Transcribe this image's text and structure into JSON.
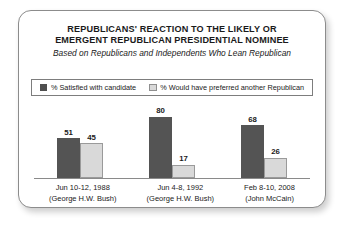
{
  "chart_data": {
    "type": "bar",
    "title": "REPUBLICANS' REACTION TO THE LIKELY OR EMERGENT REPUBLICAN PRESIDENTIAL NOMINEE",
    "title_lines": [
      "REPUBLICANS' REACTION TO THE LIKELY OR",
      "EMERGENT REPUBLICAN PRESIDENTIAL NOMINEE"
    ],
    "subtitle": "Based on Republicans and Independents Who Lean Republican",
    "xlabel": "",
    "ylabel": "",
    "ylim": [
      0,
      80
    ],
    "grid": false,
    "legend_position": "top",
    "categories": [
      "Jun 10-12, 1988",
      "Jun 4-8, 1992",
      "Feb 8-10, 2008"
    ],
    "category_sublabels": [
      "(George H.W. Bush)",
      "(George H.W. Bush)",
      "(John McCain)"
    ],
    "series": [
      {
        "name": "% Satisfied with candidate",
        "color": "#545454",
        "values": [
          51,
          80,
          68
        ]
      },
      {
        "name": "% Would have preferred another Republican",
        "color": "#d9d9d9",
        "values": [
          45,
          17,
          26
        ]
      }
    ]
  },
  "colors": {
    "dark_bar": "#545454",
    "light_bar": "#d9d9d9",
    "frame_border": "#8c8c8c",
    "axis_line": "#8a8a8a",
    "text": "#1a1a1a"
  }
}
